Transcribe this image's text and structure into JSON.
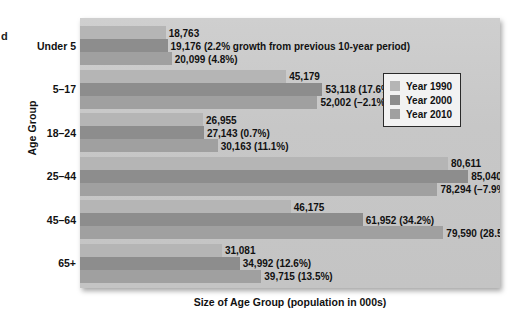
{
  "figure": {
    "edge_artifact": "d",
    "axis_title_y": "Age Group",
    "axis_title_x": "Size of Age Group (population in 000s)"
  },
  "legend": {
    "items": [
      {
        "label": "Year 1990",
        "color": "#b5b5b5",
        "key": "y1990"
      },
      {
        "label": "Year 2000",
        "color": "#8d8d8d",
        "key": "y2000"
      },
      {
        "label": "Year 2010",
        "color": "#a0a0a0",
        "key": "y2010"
      }
    ]
  },
  "chart_data": {
    "type": "bar",
    "orientation": "horizontal",
    "title": "",
    "xlabel": "Size of Age Group (population in 000s)",
    "ylabel": "Age Group",
    "grid": false,
    "legend_position": "upper right",
    "xlim": [
      0,
      92000
    ],
    "categories": [
      "Under 5",
      "5–17",
      "18–24",
      "25–44",
      "45–64",
      "65+"
    ],
    "series": [
      {
        "name": "Year 1990",
        "color": "#b5b5b5",
        "values": [
          18763,
          45179,
          26955,
          80611,
          46175,
          31081
        ]
      },
      {
        "name": "Year 2000",
        "color": "#8d8d8d",
        "values": [
          19176,
          53118,
          27143,
          85040,
          61952,
          34992
        ]
      },
      {
        "name": "Year 2010",
        "color": "#a0a0a0",
        "values": [
          20099,
          52002,
          30163,
          78294,
          79590,
          39715
        ]
      }
    ],
    "bar_labels": [
      {
        "category": "Under 5",
        "labels": [
          "18,763",
          "19,176 (2.2% growth from previous 10-year period)",
          "20,099 (4.8%)"
        ]
      },
      {
        "category": "5–17",
        "labels": [
          "45,179",
          "53,118 (17.6%)",
          "52,002 (–2.1%)"
        ]
      },
      {
        "category": "18–24",
        "labels": [
          "26,955",
          "27,143 (0.7%)",
          "30,163 (11.1%)"
        ]
      },
      {
        "category": "25–44",
        "labels": [
          "80,611",
          "85,040 (5.5%)",
          "78,294 (–7.9%)"
        ]
      },
      {
        "category": "45–64",
        "labels": [
          "46,175",
          "61,952 (34.2%)",
          "79,590 (28.5%)"
        ]
      },
      {
        "category": "65+",
        "labels": [
          "31,081",
          "34,992 (12.6%)",
          "39,715 (13.5%)"
        ]
      }
    ]
  }
}
